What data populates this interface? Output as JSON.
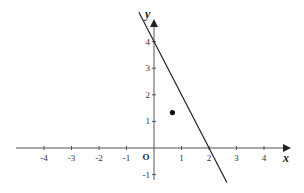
{
  "chart_data": {
    "type": "line",
    "title": "",
    "xlabel": "x",
    "ylabel": "y",
    "origin_label": "O",
    "xlim": [
      -5,
      4.9
    ],
    "ylim": [
      -1.3,
      4.8
    ],
    "x_ticks": [
      -4,
      -3,
      -2,
      -1,
      1,
      2,
      3,
      4
    ],
    "x_tick_labels": [
      "-4",
      "-3",
      "-2",
      "-1",
      "1",
      "2",
      "3",
      "4"
    ],
    "y_ticks": [
      -1,
      1,
      2,
      3,
      4
    ],
    "y_tick_labels": [
      "-1",
      "1",
      "2",
      "3",
      "4"
    ],
    "grid": false,
    "series": [
      {
        "name": "line",
        "kind": "line",
        "equation": "y = -2x + 4",
        "x": [
          -0.55,
          2.65
        ],
        "y": [
          5.1,
          -1.3
        ],
        "intercepts": {
          "x": 2,
          "y": 4
        },
        "color": "#222222"
      },
      {
        "name": "point",
        "kind": "scatter",
        "x": [
          0.67
        ],
        "y": [
          1.33
        ],
        "color": "#111111"
      }
    ]
  }
}
